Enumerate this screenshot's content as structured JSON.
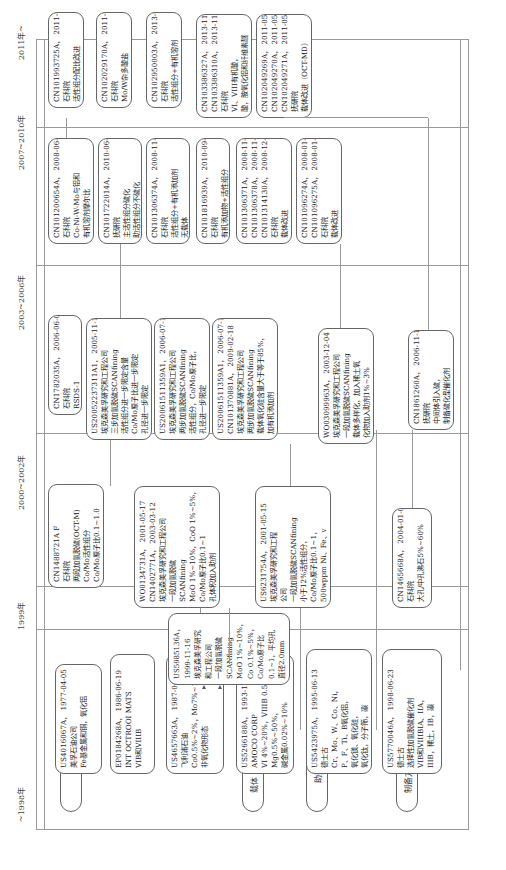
{
  "eras": [
    {
      "label": "~1998年"
    },
    {
      "label": "1999年"
    },
    {
      "label": "2000~2002年"
    },
    {
      "label": "2003~2006年"
    },
    {
      "label": "2007~2010年"
    },
    {
      "label": "2011年~"
    }
  ],
  "categories": [
    {
      "label": "活性组分"
    },
    {
      "label": "载体"
    },
    {
      "label": "助剂"
    },
    {
      "label": "制备方法"
    }
  ],
  "boxes": {
    "b1977": {
      "lines": [
        "US4016067A，  1977-04-05",
        "美孚石油公司",
        "Fe基金属和铜，氧化铝"
      ]
    },
    "b1986": {
      "lines": [
        "EP0184268A，  1986-06-19",
        "INT OCTROOI MATS",
        "VIB和VIIIB"
      ]
    },
    "b1987": {
      "lines": [
        "US4657663A，  1987-04-14",
        "飞利浦石油",
        "Co0.5%~2%，Mo7%~10%",
        "非氧化物形态"
      ]
    },
    "b1993": {
      "lines": [
        "US5266188A，  1993-11-30",
        "AMOCO CORP",
        "VI 4%~20%，VIIIB 0.5%~10%，",
        "Mg0.5%~50%，",
        "碱金属0.02%~10%"
      ]
    },
    "b1995": {
      "lines": [
        "US5423975A，  1995-06-13",
        "德士古",
        "Cr、Mo、W、Co、Ni，",
        "P、F、Ti、B氧化铝，",
        "氧化镁、氧化硅，",
        "氧化钛，分子筛，碳"
      ]
    },
    "b1998": {
      "lines": [
        "US5770046A，  1998-06-23",
        "德士古",
        "选择性加氢脱硫催化剂",
        "VIB和VIIIBIA、IIA，",
        "IIIB，稀土，IB，碳"
      ]
    },
    "b1999": {
      "lines": [
        "US5985136A，",
        "1999-11-16",
        "埃克森美孚研究",
        "和工程公司",
        "一段加氢脱硫",
        "SCANfining",
        "MoO 1%~10%，",
        "Co 0.1%~5%，",
        "Co/Mo原子比",
        "0.1~1，平均孔",
        "直径2.0mm"
      ]
    },
    "b2002a": {
      "lines": [
        "CN1488721A F",
        "石科院",
        "两段加氢脱硫(OCT-M)",
        "Co/Mo活性组分",
        "Co/Mo原子比0.1~1.0"
      ]
    },
    "b2002b": {
      "lines": [
        "WO0134731A，  2001-05-17",
        "CN1402771A，  2003-03-12",
        "埃克森美孚研究和工程公司",
        "一段加氢脱硫",
        "SCANfining",
        "MoO 1%~10%，CoO 1%~5%，",
        "Co/Mo原子比0.1~1",
        "孔体积加入助剂"
      ]
    },
    "b2002c": {
      "lines": [
        "US6231754A，  2001-05-15",
        "埃克森美孚研究和工程",
        "公司",
        "一段加氢脱硫SCANfining",
        "小于12%活性组分，",
        "Co/Mo原子比0.1~1，",
        "500wppm Ni、Fe、v"
      ]
    },
    "b2004": {
      "lines": [
        "CN1465668A，  2004-01-07",
        "石科院",
        "大孔/中孔沸石5%~60%"
      ]
    },
    "b2006a": {
      "lines": [
        "CN1782035A，  2006-06-07",
        "石科院",
        "RSDS-1"
      ]
    },
    "b2006b": {
      "lines": [
        "US20052237311A1，  2005-11-17",
        "埃克森美孚研究和工程公司",
        "三步加氢脱硫SCANfining",
        "活性组分进一步限定含量",
        "Co/Mo原子比进一步限定",
        "孔径进一步限定"
      ]
    },
    "b2006c": {
      "lines": [
        "US20061511359A1，  2006-07-13",
        "埃克森美孚研究和工程公司",
        "两步加氢脱硫SCANfining",
        "活性组分，Co/Mo原子比，",
        "孔径进一步限定"
      ]
    },
    "b2006d": {
      "lines": [
        "US20061511359A1，  2006-07-13",
        "CN101370881A，  2009-02-18",
        "埃克森美孚研究和工程公司",
        "两步加氢脱硫SCANfining",
        "载体氧化硅含量大于等于85%，",
        "加有机添加剂"
      ]
    },
    "b2003": {
      "lines": [
        "WO03099963A，  2003-12-04",
        "埃克森美孚研究和工程公司",
        "一段加氢脱硫SCANfining",
        "载体多样化，加入稀土氧",
        "化物加入助剂1%~3%"
      ]
    },
    "b2006e": {
      "lines": [
        "CN1861260A，  2006-11-15",
        "抚研院",
        "中间体引入硫，",
        "制备硫化型催化剂"
      ]
    },
    "b2008a": {
      "lines": [
        "CN101200654A，  2008-06-18",
        "石科院",
        "Co-Ni-W-Mo与铝和",
        "有机溶剂摩尔比"
      ]
    },
    "b2010a": {
      "lines": [
        "CN101722014A，  2010-06-09",
        "抚研院",
        "主活性组分硫化",
        "助活性组分不硫化"
      ]
    },
    "b2008b": {
      "lines": [
        "CN101306374A，  2008-11-19",
        "石科院",
        "活性组分+有机添加剂",
        "无载体"
      ]
    },
    "b2010b": {
      "lines": [
        "CN101816939A，  2010-09-01",
        "石科院",
        "有机添加物+活性组分"
      ]
    },
    "b2008c": {
      "lines": [
        "CN101306371A，  2008-11-19",
        "CN101306378A，  2008-11-19",
        "CN101314130A，  2008-12-03",
        "石科院",
        "载体改进"
      ]
    },
    "b2008d": {
      "lines": [
        "CN101096274A，  2008-01-02",
        "CN101096275A，  2008-01-02",
        "石科院",
        "载体改进"
      ]
    },
    "b2011a": {
      "lines": [
        "CN101993725A，  2011-03-30",
        "石科院",
        "活性组分配比改进"
      ]
    },
    "b2011b": {
      "lines": [
        "CN102029170A，  2011-04-27",
        "石科院",
        "Mo/W杂多酸盐"
      ]
    },
    "b2013a": {
      "lines": [
        "CN102950003A，  2013-03-06",
        "石科院",
        "活性组分+有机溶剂"
      ]
    },
    "b2013b": {
      "lines": [
        "CN103386327A，  2013-11-13",
        "CN103386310A，  2013-11-13",
        "石科院",
        "VI、VIII有机酸，",
        "酸，胺氧化铝和纤维素醚"
      ]
    },
    "b2011c": {
      "lines": [
        "CN102049269A，  2011-05-11",
        "CN102049270A，  2011-05-11",
        "CN102049271A，  2011-05-11",
        "抚研院",
        "载体改进（OCT-MD）"
      ]
    }
  }
}
